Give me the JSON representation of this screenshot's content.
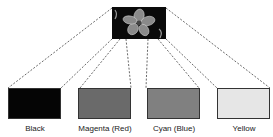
{
  "diagram": {
    "source_image": {
      "description": "flower photo",
      "icon": "flower-photo"
    },
    "separations": [
      {
        "label": "Black",
        "color": "#050505"
      },
      {
        "label": "Magenta (Red)",
        "color": "#6a6a6a"
      },
      {
        "label": "Cyan (Blue)",
        "color": "#808080"
      },
      {
        "label": "Yellow",
        "color": "#e6e6e6"
      }
    ]
  }
}
